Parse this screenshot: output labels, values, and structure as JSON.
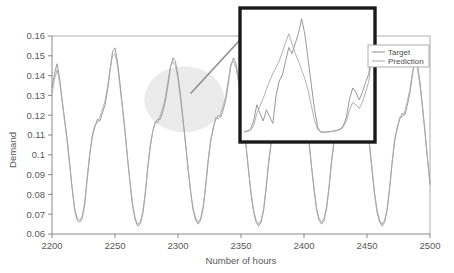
{
  "chart_data": {
    "type": "line",
    "title": "",
    "xlabel": "Number of hours",
    "ylabel": "Demand",
    "xlim": [
      2200,
      2500
    ],
    "ylim": [
      0.06,
      0.16
    ],
    "xticks": [
      2200,
      2250,
      2300,
      2350,
      2400,
      2450,
      2500
    ],
    "xtick_labels": [
      "2200",
      "2250",
      "2300",
      "2350",
      "2400",
      "2450",
      "2500"
    ],
    "yticks": [
      0.06,
      0.07,
      0.08,
      0.09,
      0.1,
      0.11,
      0.12,
      0.13,
      0.14,
      0.15,
      0.16
    ],
    "ytick_labels": [
      "0.06",
      "0.07",
      "0.08",
      "0.09",
      "0.1",
      "0.11",
      "0.12",
      "0.13",
      "0.14",
      "0.15",
      "0.16"
    ],
    "grid": false,
    "legend_position": "upper-right",
    "series": [
      {
        "name": "Target",
        "color": "#8c8c8e",
        "x": [
          2200,
          2202,
          2204,
          2206,
          2208,
          2210,
          2212,
          2214,
          2216,
          2218,
          2220,
          2222,
          2224,
          2226,
          2228,
          2230,
          2232,
          2234,
          2236,
          2238,
          2240,
          2242,
          2244,
          2246,
          2248,
          2250,
          2252,
          2254,
          2256,
          2258,
          2260,
          2262,
          2264,
          2266,
          2268,
          2270,
          2272,
          2274,
          2276,
          2278,
          2280,
          2282,
          2284,
          2286,
          2288,
          2290,
          2292,
          2294,
          2296,
          2298,
          2300,
          2302,
          2304,
          2306,
          2308,
          2310,
          2312,
          2314,
          2316,
          2318,
          2320,
          2322,
          2324,
          2326,
          2328,
          2330,
          2332,
          2334,
          2336,
          2338,
          2340,
          2342,
          2344,
          2346,
          2348,
          2350,
          2352,
          2354,
          2356,
          2358,
          2360,
          2362,
          2364,
          2366,
          2368,
          2370,
          2372,
          2374,
          2376,
          2378,
          2380,
          2382,
          2384,
          2386,
          2388,
          2390,
          2392,
          2394,
          2396,
          2398,
          2400,
          2402,
          2404,
          2406,
          2408,
          2410,
          2412,
          2414,
          2416,
          2418,
          2420,
          2422,
          2424,
          2426,
          2428,
          2430,
          2432,
          2434,
          2436,
          2438,
          2440,
          2442,
          2444,
          2446,
          2448,
          2450,
          2452,
          2454,
          2456,
          2458,
          2460,
          2462,
          2464,
          2466,
          2468,
          2470,
          2472,
          2474,
          2476,
          2478,
          2480,
          2482,
          2484,
          2486,
          2488,
          2490,
          2492,
          2494,
          2496,
          2498,
          2500
        ],
        "y": [
          0.134,
          0.141,
          0.146,
          0.139,
          0.128,
          0.118,
          0.108,
          0.096,
          0.083,
          0.072,
          0.067,
          0.066,
          0.068,
          0.075,
          0.088,
          0.1,
          0.109,
          0.114,
          0.118,
          0.117,
          0.121,
          0.125,
          0.132,
          0.142,
          0.152,
          0.154,
          0.147,
          0.136,
          0.124,
          0.112,
          0.098,
          0.085,
          0.074,
          0.067,
          0.064,
          0.065,
          0.07,
          0.08,
          0.093,
          0.104,
          0.112,
          0.116,
          0.118,
          0.118,
          0.122,
          0.127,
          0.135,
          0.144,
          0.149,
          0.147,
          0.14,
          0.13,
          0.118,
          0.106,
          0.093,
          0.081,
          0.072,
          0.067,
          0.065,
          0.067,
          0.073,
          0.084,
          0.097,
          0.107,
          0.114,
          0.118,
          0.12,
          0.119,
          0.123,
          0.128,
          0.136,
          0.145,
          0.149,
          0.146,
          0.139,
          0.129,
          0.117,
          0.105,
          0.092,
          0.08,
          0.071,
          0.066,
          0.064,
          0.066,
          0.072,
          0.083,
          0.096,
          0.106,
          0.113,
          0.117,
          0.12,
          0.119,
          0.124,
          0.13,
          0.139,
          0.148,
          0.154,
          0.16,
          0.153,
          0.142,
          0.131,
          0.119,
          0.107,
          0.094,
          0.082,
          0.072,
          0.067,
          0.065,
          0.067,
          0.073,
          0.084,
          0.097,
          0.107,
          0.114,
          0.118,
          0.12,
          0.119,
          0.123,
          0.128,
          0.136,
          0.145,
          0.15,
          0.147,
          0.14,
          0.13,
          0.118,
          0.105,
          0.092,
          0.08,
          0.071,
          0.066,
          0.064,
          0.066,
          0.072,
          0.083,
          0.096,
          0.107,
          0.114,
          0.118,
          0.121,
          0.12,
          0.125,
          0.131,
          0.14,
          0.149,
          0.146,
          0.137,
          0.125,
          0.112,
          0.098,
          0.085
        ]
      },
      {
        "name": "Prediction",
        "color": "#a8a8aa",
        "x": [
          2200,
          2202,
          2204,
          2206,
          2208,
          2210,
          2212,
          2214,
          2216,
          2218,
          2220,
          2222,
          2224,
          2226,
          2228,
          2230,
          2232,
          2234,
          2236,
          2238,
          2240,
          2242,
          2244,
          2246,
          2248,
          2250,
          2252,
          2254,
          2256,
          2258,
          2260,
          2262,
          2264,
          2266,
          2268,
          2270,
          2272,
          2274,
          2276,
          2278,
          2280,
          2282,
          2284,
          2286,
          2288,
          2290,
          2292,
          2294,
          2296,
          2298,
          2300,
          2302,
          2304,
          2306,
          2308,
          2310,
          2312,
          2314,
          2316,
          2318,
          2320,
          2322,
          2324,
          2326,
          2328,
          2330,
          2332,
          2334,
          2336,
          2338,
          2340,
          2342,
          2344,
          2346,
          2348,
          2350,
          2352,
          2354,
          2356,
          2358,
          2360,
          2362,
          2364,
          2366,
          2368,
          2370,
          2372,
          2374,
          2376,
          2378,
          2380,
          2382,
          2384,
          2386,
          2388,
          2390,
          2392,
          2394,
          2396,
          2398,
          2400,
          2402,
          2404,
          2406,
          2408,
          2410,
          2412,
          2414,
          2416,
          2418,
          2420,
          2422,
          2424,
          2426,
          2428,
          2430,
          2432,
          2434,
          2436,
          2438,
          2440,
          2442,
          2444,
          2446,
          2448,
          2450,
          2452,
          2454,
          2456,
          2458,
          2460,
          2462,
          2464,
          2466,
          2468,
          2470,
          2472,
          2474,
          2476,
          2478,
          2480,
          2482,
          2484,
          2486,
          2488,
          2490,
          2492,
          2494,
          2496,
          2498,
          2500
        ],
        "y": [
          0.131,
          0.138,
          0.143,
          0.137,
          0.127,
          0.117,
          0.107,
          0.095,
          0.083,
          0.073,
          0.068,
          0.067,
          0.069,
          0.076,
          0.089,
          0.101,
          0.11,
          0.115,
          0.116,
          0.119,
          0.123,
          0.127,
          0.134,
          0.143,
          0.15,
          0.151,
          0.145,
          0.134,
          0.123,
          0.111,
          0.098,
          0.086,
          0.075,
          0.068,
          0.065,
          0.066,
          0.071,
          0.081,
          0.094,
          0.105,
          0.112,
          0.117,
          0.116,
          0.12,
          0.124,
          0.129,
          0.137,
          0.145,
          0.147,
          0.145,
          0.138,
          0.128,
          0.117,
          0.105,
          0.093,
          0.082,
          0.073,
          0.068,
          0.066,
          0.068,
          0.074,
          0.085,
          0.098,
          0.108,
          0.113,
          0.119,
          0.118,
          0.121,
          0.125,
          0.13,
          0.138,
          0.146,
          0.147,
          0.144,
          0.137,
          0.128,
          0.116,
          0.104,
          0.092,
          0.081,
          0.072,
          0.067,
          0.065,
          0.067,
          0.073,
          0.084,
          0.097,
          0.107,
          0.112,
          0.118,
          0.119,
          0.121,
          0.126,
          0.132,
          0.14,
          0.147,
          0.15,
          0.155,
          0.15,
          0.14,
          0.13,
          0.118,
          0.106,
          0.094,
          0.083,
          0.073,
          0.068,
          0.066,
          0.068,
          0.074,
          0.085,
          0.098,
          0.108,
          0.113,
          0.119,
          0.118,
          0.121,
          0.125,
          0.13,
          0.138,
          0.146,
          0.148,
          0.145,
          0.138,
          0.129,
          0.117,
          0.105,
          0.093,
          0.081,
          0.072,
          0.067,
          0.065,
          0.067,
          0.073,
          0.084,
          0.097,
          0.108,
          0.113,
          0.119,
          0.119,
          0.122,
          0.127,
          0.133,
          0.141,
          0.147,
          0.144,
          0.135,
          0.124,
          0.111,
          0.098,
          0.086
        ]
      }
    ],
    "annotations": [
      {
        "type": "ellipse-highlight",
        "name": "region-of-interest-ellipse",
        "center_x": 2305,
        "center_y": 0.128
      },
      {
        "type": "arrow",
        "name": "callout-arrow",
        "from_x": 2310,
        "from_y": 0.131,
        "to_x": 2355,
        "to_y": 0.162
      },
      {
        "type": "inset-box",
        "name": "magnified-inset",
        "detail_series": [
          {
            "name": "Target",
            "color": "#8c8c8e",
            "y": [
              0.0615,
              0.062,
              0.063,
              0.07,
              0.083,
              0.076,
              0.07,
              0.079,
              0.0735,
              0.068,
              0.09,
              0.102,
              0.107,
              0.118,
              0.129,
              0.124,
              0.132,
              0.14,
              0.152,
              0.14,
              0.12,
              0.1,
              0.08,
              0.065,
              0.0612,
              0.061,
              0.0612,
              0.0615,
              0.062,
              0.0625,
              0.0635,
              0.066,
              0.073,
              0.088,
              0.0965,
              0.093,
              0.087,
              0.093,
              0.101,
              0.108,
              0.13
            ]
          },
          {
            "name": "Prediction",
            "color": "#a8a8aa",
            "y": [
              0.0612,
              0.0615,
              0.0625,
              0.066,
              0.076,
              0.082,
              0.088,
              0.0955,
              0.102,
              0.108,
              0.113,
              0.118,
              0.125,
              0.133,
              0.14,
              0.132,
              0.1245,
              0.118,
              0.111,
              0.104,
              0.095,
              0.083,
              0.071,
              0.063,
              0.0612,
              0.061,
              0.0612,
              0.0614,
              0.0618,
              0.0622,
              0.063,
              0.065,
              0.07,
              0.079,
              0.085,
              0.083,
              0.08,
              0.085,
              0.093,
              0.102,
              0.124
            ]
          }
        ]
      }
    ]
  },
  "axes": {
    "y_title": "Demand",
    "x_title": "Number of hours"
  },
  "legend": {
    "items": [
      {
        "label": "Target",
        "color": "#8c8c8e"
      },
      {
        "label": "Prediction",
        "color": "#a8a8aa"
      }
    ]
  }
}
